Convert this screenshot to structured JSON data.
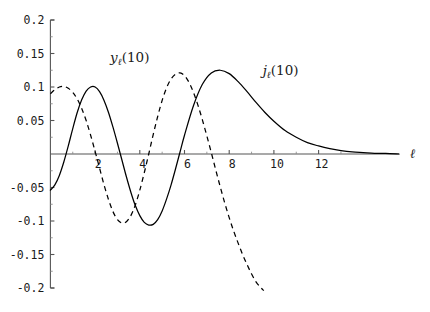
{
  "chart_data": {
    "type": "line",
    "title": "",
    "subtitle": "",
    "xlabel": "ℓ",
    "ylabel": "",
    "xlim": [
      0,
      15.6
    ],
    "ylim": [
      -0.2,
      0.2
    ],
    "grid": false,
    "legend_position": "inline-annotations",
    "x_ticks": [
      2,
      4,
      6,
      8,
      10,
      12
    ],
    "x_tick_labels": [
      "2",
      "4",
      "6",
      "8",
      "10",
      "12"
    ],
    "x_minor_ticks": [
      1,
      3,
      5,
      7,
      9,
      11,
      13
    ],
    "y_ticks": [
      0.2,
      0.15,
      0.1,
      0.05,
      -0.05,
      -0.1,
      -0.15,
      -0.2
    ],
    "y_tick_labels": [
      "0.2",
      "0.15",
      "0.1",
      "0.05",
      "-0.05",
      "-0.1",
      "-0.15",
      "-0.2"
    ],
    "y_minor_ticks": [
      0.175,
      0.125,
      0.075,
      0.025,
      -0.025,
      -0.075,
      -0.125,
      -0.175
    ],
    "series": [
      {
        "name": "j_l(10)",
        "label": "jℓ(10)",
        "label_base": "j",
        "label_sub": "ℓ",
        "label_arg": "(10)",
        "style": "solid",
        "color": "#000000",
        "annotation_x": 10.3,
        "annotation_y": 0.118,
        "x": [
          0.0,
          0.2,
          0.4,
          0.6,
          0.8,
          1.0,
          1.2,
          1.4,
          1.6,
          1.8,
          2.0,
          2.2,
          2.4,
          2.6,
          2.8,
          3.0,
          3.2,
          3.4,
          3.6,
          3.8,
          4.0,
          4.2,
          4.4,
          4.6,
          4.8,
          5.0,
          5.2,
          5.4,
          5.6,
          5.8,
          6.0,
          6.4,
          6.8,
          7.2,
          7.6,
          8.0,
          8.4,
          8.8,
          9.2,
          9.6,
          10.0,
          10.5,
          11.0,
          11.5,
          12.0,
          12.5,
          13.0,
          13.5,
          14.0,
          14.5,
          15.0,
          15.6
        ],
        "y": [
          -0.054,
          -0.046,
          -0.032,
          -0.012,
          0.012,
          0.038,
          0.062,
          0.081,
          0.094,
          0.1,
          0.1,
          0.093,
          0.08,
          0.062,
          0.04,
          0.016,
          -0.009,
          -0.034,
          -0.057,
          -0.077,
          -0.092,
          -0.102,
          -0.106,
          -0.105,
          -0.098,
          -0.085,
          -0.067,
          -0.046,
          -0.022,
          0.003,
          0.028,
          0.072,
          0.104,
          0.121,
          0.125,
          0.12,
          0.108,
          0.093,
          0.077,
          0.062,
          0.049,
          0.035,
          0.025,
          0.017,
          0.012,
          0.008,
          0.005,
          0.003,
          0.002,
          0.001,
          0.001,
          0.0
        ]
      },
      {
        "name": "y_l(10)",
        "label": "yℓ(10)",
        "label_base": "y",
        "label_sub": "ℓ",
        "label_arg": "(10)",
        "style": "dashed",
        "color": "#000000",
        "annotation_x": 3.55,
        "annotation_y": 0.138,
        "x": [
          0.0,
          0.2,
          0.4,
          0.6,
          0.8,
          1.0,
          1.2,
          1.4,
          1.6,
          1.8,
          2.0,
          2.2,
          2.4,
          2.6,
          2.8,
          3.0,
          3.2,
          3.4,
          3.6,
          3.8,
          4.0,
          4.2,
          4.4,
          4.6,
          4.8,
          5.0,
          5.2,
          5.4,
          5.6,
          5.8,
          6.0,
          6.2,
          6.4,
          6.6,
          6.8,
          7.0,
          7.2,
          7.4,
          7.6,
          7.8,
          8.0,
          8.2,
          8.4,
          8.6,
          8.8,
          9.0,
          9.2,
          9.4,
          9.55
        ],
        "y": [
          0.09,
          0.096,
          0.1,
          0.101,
          0.098,
          0.092,
          0.082,
          0.068,
          0.05,
          0.028,
          0.004,
          -0.021,
          -0.046,
          -0.068,
          -0.086,
          -0.098,
          -0.103,
          -0.101,
          -0.092,
          -0.076,
          -0.054,
          -0.028,
          0.0,
          0.029,
          0.056,
          0.08,
          0.099,
          0.112,
          0.119,
          0.121,
          0.117,
          0.107,
          0.092,
          0.073,
          0.051,
          0.027,
          0.002,
          -0.024,
          -0.049,
          -0.073,
          -0.095,
          -0.115,
          -0.133,
          -0.15,
          -0.165,
          -0.179,
          -0.191,
          -0.199,
          -0.204
        ]
      }
    ]
  },
  "axis": {
    "x_label": "ℓ"
  }
}
